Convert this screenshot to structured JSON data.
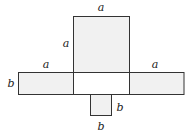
{
  "diagram": {
    "title": "",
    "colors": {
      "fill": "#f1f1f1",
      "center_fill": "#ffffff",
      "stroke": "#333333",
      "text": "#222222"
    },
    "labels": {
      "top_square_top": "a",
      "top_square_left": "a",
      "left_strip_top": "a",
      "left_strip_left": "b",
      "right_strip_top": "a",
      "small_square_right": "b",
      "small_square_bottom": "b"
    }
  }
}
